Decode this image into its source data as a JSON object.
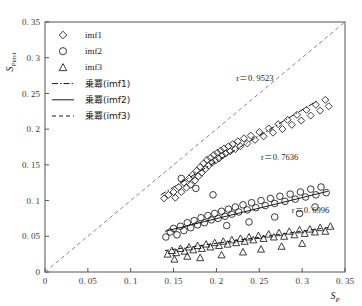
{
  "chart_data": {
    "type": "scatter",
    "title": "",
    "xlabel": "S_p",
    "ylabel": "S_Pim/t",
    "xlim": [
      0,
      0.35
    ],
    "ylim": [
      0,
      0.35
    ],
    "xticks": [
      "0",
      "0. 05",
      "0. 1",
      "0. 15",
      "0. 2",
      "0. 25",
      "0. 3",
      "0. 35"
    ],
    "yticks": [
      "0",
      "0. 05",
      "0. 1",
      "0. 15",
      "0. 2",
      "0. 25",
      "0. 3",
      "0. 35"
    ],
    "xtick_values": [
      0,
      0.05,
      0.1,
      0.15,
      0.2,
      0.25,
      0.3,
      0.35
    ],
    "ytick_values": [
      0,
      0.05,
      0.1,
      0.15,
      0.2,
      0.25,
      0.3,
      0.35
    ],
    "grid": false,
    "legend_position": "upper-left",
    "legend": [
      {
        "label": "imf1",
        "marker": "diamond",
        "kind": "marker"
      },
      {
        "label": "imf2",
        "marker": "circle",
        "kind": "marker"
      },
      {
        "label": "imf3",
        "marker": "triangle",
        "kind": "marker"
      },
      {
        "label": "乗冪(imf1)",
        "marker": "dashdot-line",
        "kind": "line"
      },
      {
        "label": "乗冪(imf2)",
        "marker": "solid-line",
        "kind": "line"
      },
      {
        "label": "乗冪(imf3)",
        "marker": "dashed-line",
        "kind": "line"
      }
    ],
    "annotations": [
      {
        "text": "r＝0. 9523",
        "x": 0.223,
        "y": 0.268,
        "series": "imf1"
      },
      {
        "text": "r＝0. 7636",
        "x": 0.252,
        "y": 0.157,
        "series": "imf2"
      },
      {
        "text": "r＝0. 6996",
        "x": 0.288,
        "y": 0.083,
        "series": "imf3"
      }
    ],
    "reference_line": {
      "kind": "identity",
      "style": "dashed",
      "from": [
        0,
        0
      ],
      "to": [
        0.35,
        0.35
      ]
    },
    "series": [
      {
        "name": "imf1",
        "marker": "diamond",
        "trend_style": "dashdot",
        "trend": {
          "from": [
            0.135,
            0.108
          ],
          "to": [
            0.318,
            0.24
          ]
        },
        "points": [
          [
            0.139,
            0.103
          ],
          [
            0.144,
            0.108
          ],
          [
            0.15,
            0.112
          ],
          [
            0.152,
            0.104
          ],
          [
            0.156,
            0.119
          ],
          [
            0.159,
            0.112
          ],
          [
            0.162,
            0.125
          ],
          [
            0.165,
            0.118
          ],
          [
            0.168,
            0.131
          ],
          [
            0.17,
            0.122
          ],
          [
            0.172,
            0.136
          ],
          [
            0.175,
            0.128
          ],
          [
            0.177,
            0.142
          ],
          [
            0.179,
            0.134
          ],
          [
            0.181,
            0.147
          ],
          [
            0.183,
            0.139
          ],
          [
            0.185,
            0.152
          ],
          [
            0.187,
            0.144
          ],
          [
            0.189,
            0.157
          ],
          [
            0.191,
            0.149
          ],
          [
            0.193,
            0.16
          ],
          [
            0.195,
            0.153
          ],
          [
            0.197,
            0.164
          ],
          [
            0.199,
            0.156
          ],
          [
            0.201,
            0.167
          ],
          [
            0.203,
            0.159
          ],
          [
            0.205,
            0.17
          ],
          [
            0.207,
            0.163
          ],
          [
            0.209,
            0.173
          ],
          [
            0.211,
            0.166
          ],
          [
            0.214,
            0.176
          ],
          [
            0.216,
            0.169
          ],
          [
            0.219,
            0.179
          ],
          [
            0.222,
            0.172
          ],
          [
            0.225,
            0.183
          ],
          [
            0.228,
            0.176
          ],
          [
            0.232,
            0.187
          ],
          [
            0.236,
            0.18
          ],
          [
            0.24,
            0.191
          ],
          [
            0.245,
            0.185
          ],
          [
            0.25,
            0.196
          ],
          [
            0.255,
            0.19
          ],
          [
            0.261,
            0.201
          ],
          [
            0.266,
            0.195
          ],
          [
            0.272,
            0.207
          ],
          [
            0.277,
            0.2
          ],
          [
            0.283,
            0.213
          ],
          [
            0.288,
            0.206
          ],
          [
            0.294,
            0.22
          ],
          [
            0.299,
            0.212
          ],
          [
            0.305,
            0.227
          ],
          [
            0.31,
            0.219
          ],
          [
            0.316,
            0.234
          ],
          [
            0.321,
            0.226
          ],
          [
            0.327,
            0.241
          ],
          [
            0.331,
            0.232
          ]
        ]
      },
      {
        "name": "imf2",
        "marker": "circle",
        "trend_style": "solid",
        "trend": {
          "from": [
            0.14,
            0.057
          ],
          "to": [
            0.33,
            0.113
          ]
        },
        "points": [
          [
            0.141,
            0.049
          ],
          [
            0.146,
            0.056
          ],
          [
            0.15,
            0.061
          ],
          [
            0.154,
            0.052
          ],
          [
            0.158,
            0.064
          ],
          [
            0.162,
            0.058
          ],
          [
            0.166,
            0.069
          ],
          [
            0.17,
            0.062
          ],
          [
            0.174,
            0.072
          ],
          [
            0.178,
            0.066
          ],
          [
            0.182,
            0.076
          ],
          [
            0.186,
            0.069
          ],
          [
            0.19,
            0.079
          ],
          [
            0.194,
            0.073
          ],
          [
            0.198,
            0.082
          ],
          [
            0.202,
            0.075
          ],
          [
            0.206,
            0.085
          ],
          [
            0.21,
            0.078
          ],
          [
            0.214,
            0.088
          ],
          [
            0.218,
            0.081
          ],
          [
            0.222,
            0.091
          ],
          [
            0.226,
            0.084
          ],
          [
            0.231,
            0.094
          ],
          [
            0.236,
            0.087
          ],
          [
            0.241,
            0.097
          ],
          [
            0.246,
            0.09
          ],
          [
            0.252,
            0.1
          ],
          [
            0.257,
            0.093
          ],
          [
            0.263,
            0.103
          ],
          [
            0.268,
            0.096
          ],
          [
            0.274,
            0.106
          ],
          [
            0.28,
            0.099
          ],
          [
            0.286,
            0.109
          ],
          [
            0.292,
            0.102
          ],
          [
            0.298,
            0.112
          ],
          [
            0.304,
            0.105
          ],
          [
            0.31,
            0.116
          ],
          [
            0.316,
            0.108
          ],
          [
            0.322,
            0.119
          ],
          [
            0.328,
            0.111
          ],
          [
            0.159,
            0.131
          ],
          [
            0.176,
            0.117
          ],
          [
            0.196,
            0.108
          ],
          [
            0.212,
            0.065
          ],
          [
            0.238,
            0.07
          ],
          [
            0.268,
            0.077
          ],
          [
            0.297,
            0.082
          ],
          [
            0.315,
            0.091
          ]
        ]
      },
      {
        "name": "imf3",
        "marker": "triangle",
        "trend_style": "dashed",
        "trend": {
          "from": [
            0.14,
            0.03
          ],
          "to": [
            0.335,
            0.063
          ]
        },
        "points": [
          [
            0.143,
            0.025
          ],
          [
            0.148,
            0.03
          ],
          [
            0.153,
            0.027
          ],
          [
            0.158,
            0.033
          ],
          [
            0.163,
            0.029
          ],
          [
            0.168,
            0.035
          ],
          [
            0.173,
            0.031
          ],
          [
            0.178,
            0.037
          ],
          [
            0.183,
            0.033
          ],
          [
            0.188,
            0.039
          ],
          [
            0.193,
            0.035
          ],
          [
            0.198,
            0.041
          ],
          [
            0.203,
            0.037
          ],
          [
            0.208,
            0.043
          ],
          [
            0.213,
            0.039
          ],
          [
            0.218,
            0.045
          ],
          [
            0.223,
            0.041
          ],
          [
            0.228,
            0.047
          ],
          [
            0.233,
            0.043
          ],
          [
            0.238,
            0.049
          ],
          [
            0.243,
            0.045
          ],
          [
            0.249,
            0.051
          ],
          [
            0.255,
            0.047
          ],
          [
            0.261,
            0.053
          ],
          [
            0.267,
            0.049
          ],
          [
            0.273,
            0.055
          ],
          [
            0.279,
            0.05
          ],
          [
            0.285,
            0.057
          ],
          [
            0.291,
            0.052
          ],
          [
            0.297,
            0.059
          ],
          [
            0.303,
            0.054
          ],
          [
            0.309,
            0.06
          ],
          [
            0.315,
            0.056
          ],
          [
            0.321,
            0.062
          ],
          [
            0.327,
            0.057
          ],
          [
            0.333,
            0.064
          ],
          [
            0.151,
            0.018
          ],
          [
            0.166,
            0.022
          ],
          [
            0.181,
            0.02
          ],
          [
            0.206,
            0.024
          ],
          [
            0.231,
            0.028
          ],
          [
            0.252,
            0.032
          ],
          [
            0.276,
            0.036
          ],
          [
            0.3,
            0.04
          ]
        ]
      }
    ]
  }
}
